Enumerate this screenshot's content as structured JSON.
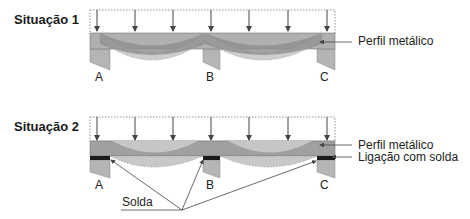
{
  "situation1": {
    "title": "Situação 1",
    "supports": [
      "A",
      "B",
      "C"
    ],
    "callout": "Perfil metálico"
  },
  "situation2": {
    "title": "Situação 2",
    "supports": [
      "A",
      "B",
      "C"
    ],
    "callouts": [
      "Perfil metálico",
      "Ligação com solda"
    ],
    "weld_label": "Solda"
  },
  "colors": {
    "beam": "#a9a9a9",
    "beam_dark": "#8c8c8c",
    "deflection": "#c8c8c8",
    "support": "#b5b5b5",
    "weld": "#1a1a1a",
    "line": "#444444"
  }
}
